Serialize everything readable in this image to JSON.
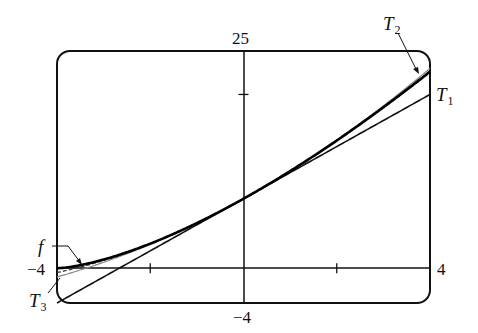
{
  "chart_data": {
    "type": "line",
    "title": "",
    "xlabel": "",
    "ylabel": "",
    "xlim": [
      -4,
      4
    ],
    "ylim": [
      -4,
      25
    ],
    "grid": false,
    "axis_labels": {
      "x_min": "−4",
      "x_max": "4",
      "y_min": "−4",
      "y_max": "25"
    },
    "x_ticks": [
      -2,
      2
    ],
    "y_ticks": [
      20
    ],
    "series": [
      {
        "name": "f",
        "label": "f",
        "formula": "8(1 + x/4)^(3/2)",
        "style": "thick solid",
        "x": [
          -4,
          -3,
          -2,
          -1,
          0,
          1,
          2,
          3,
          4
        ],
        "values": [
          0.0,
          1.0,
          2.83,
          5.2,
          8.0,
          11.18,
          14.7,
          18.52,
          22.63
        ]
      },
      {
        "name": "T1",
        "label": "T",
        "subscript": "1",
        "formula": "8 + 3x",
        "style": "solid",
        "x": [
          -4,
          4
        ],
        "values": [
          -4.0,
          20.0
        ]
      },
      {
        "name": "T2",
        "label": "T",
        "subscript": "2",
        "formula": "8 + 3x + (3/16)x^2",
        "style": "light gray",
        "x": [
          -4,
          -2,
          0,
          2,
          4
        ],
        "values": [
          -1.0,
          2.75,
          8.0,
          14.75,
          23.0
        ]
      },
      {
        "name": "T3",
        "label": "T",
        "subscript": "3",
        "formula": "8 + 3x + (3/16)x^2 - (1/128)x^3",
        "style": "dashed",
        "x": [
          -4,
          -2,
          0,
          2,
          4
        ],
        "values": [
          -0.5,
          2.81,
          8.0,
          14.69,
          22.5
        ]
      }
    ],
    "annotations": [
      {
        "text": "f",
        "points_to": "f near x=-3.5"
      },
      {
        "text": "T2",
        "points_to": "T2 near x=4"
      },
      {
        "text": "T1",
        "points_to": "T1 at right edge"
      },
      {
        "text": "T3",
        "points_to": "T3 near x=-4"
      }
    ]
  }
}
